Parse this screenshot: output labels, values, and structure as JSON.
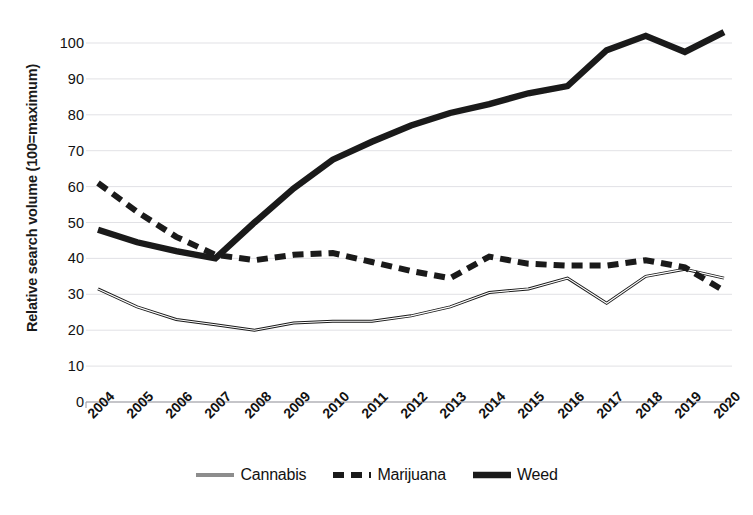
{
  "chart_data": {
    "type": "line",
    "title": "",
    "xlabel": "",
    "ylabel": "Relative search volume (100=maximum)",
    "x": [
      "2004",
      "2005",
      "2006",
      "2007",
      "2008",
      "2009",
      "2010",
      "2011",
      "2012",
      "2013",
      "2014",
      "2015",
      "2016",
      "2017",
      "2018",
      "2019",
      "2020"
    ],
    "categories": [
      "2004",
      "2005",
      "2006",
      "2007",
      "2008",
      "2009",
      "2010",
      "2011",
      "2012",
      "2013",
      "2014",
      "2015",
      "2016",
      "2017",
      "2018",
      "2019",
      "2020"
    ],
    "series": [
      {
        "name": "Cannabis",
        "style": "thin-solid",
        "color": "#1a1a1a",
        "values": [
          31.5,
          26.5,
          23.0,
          21.5,
          20.0,
          22.0,
          22.5,
          22.5,
          24.0,
          26.5,
          30.5,
          31.5,
          34.5,
          27.5,
          35.0,
          37.0,
          34.5
        ]
      },
      {
        "name": "Marijuana",
        "style": "dashed",
        "color": "#1a1a1a",
        "values": [
          61.0,
          53.0,
          46.0,
          41.0,
          39.5,
          41.0,
          41.5,
          39.0,
          36.5,
          34.5,
          40.5,
          38.5,
          38.0,
          38.0,
          39.5,
          37.5,
          31.0
        ]
      },
      {
        "name": "Weed",
        "style": "thick-solid",
        "color": "#1a1a1a",
        "values": [
          48.0,
          44.5,
          42.0,
          40.0,
          50.0,
          59.5,
          67.5,
          72.5,
          77.0,
          80.5,
          83.0,
          86.0,
          88.0,
          98.0,
          102.0,
          97.5,
          103.0
        ]
      }
    ],
    "ylim": [
      0,
      105
    ],
    "y_ticks": [
      0,
      10,
      20,
      30,
      40,
      50,
      60,
      70,
      80,
      90,
      100
    ],
    "grid": "horizontal",
    "legend_position": "bottom",
    "legend_entries": [
      "Cannabis",
      "Marijuana",
      "Weed"
    ],
    "background": "#ffffff",
    "axis_color": "#9a9aa0",
    "gridline_color": "#d9d9de"
  }
}
